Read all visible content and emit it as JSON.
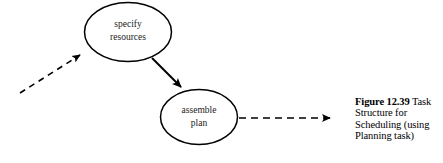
{
  "figure": {
    "caption_label": "Figure 12.39",
    "caption_text": " Task Structure for Scheduling (using Planning task)",
    "caption_full": "Figure 12.39  Task Structure for Scheduling (using Planning task)"
  },
  "diagram": {
    "type": "task-structure-graph",
    "stroke_color": "#000000",
    "background_color": "#ffffff",
    "nodes": [
      {
        "id": "specify-resources",
        "label_line1": "specify",
        "label_line2": "resources",
        "shape": "ellipse",
        "cx": 128,
        "cy": 32,
        "rx": 44,
        "ry": 30
      },
      {
        "id": "assemble-plan",
        "label_line1": "assemble",
        "label_line2": "plan",
        "shape": "ellipse",
        "cx": 199,
        "cy": 117,
        "rx": 39,
        "ry": 28
      }
    ],
    "edges": [
      {
        "id": "incoming-dashed-arrow",
        "style": "dashed",
        "from_x": 20,
        "from_y": 93,
        "to_x": 86,
        "to_y": 51,
        "arrowhead": "filled"
      },
      {
        "id": "specify-to-assemble-arrow",
        "style": "solid",
        "from_x": 152,
        "from_y": 58,
        "to_x": 185,
        "to_y": 91,
        "arrowhead": "filled"
      },
      {
        "id": "outgoing-dashed-arrow",
        "style": "dashed",
        "from_x": 239,
        "from_y": 118,
        "to_x": 336,
        "to_y": 118,
        "arrowhead": "filled"
      }
    ]
  }
}
